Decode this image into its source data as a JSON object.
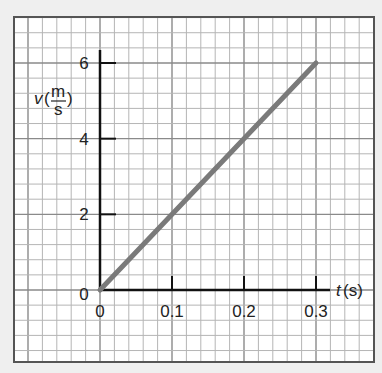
{
  "header": {
    "partial_title": "graph"
  },
  "chart_data": {
    "type": "line",
    "title": "",
    "xlabel": "t(s)",
    "ylabel": "v(m/s)",
    "ylabel_parts": {
      "var": "v",
      "num": "m",
      "den": "s"
    },
    "xlabel_parts": {
      "var": "t",
      "unit": "(s)"
    },
    "x_ticks": [
      0,
      0.1,
      0.2,
      0.3
    ],
    "x_tick_labels": [
      "0",
      "0.1",
      "0.2",
      "0.3"
    ],
    "y_ticks": [
      0,
      2,
      4,
      6
    ],
    "y_tick_labels": [
      "0",
      "2",
      "4",
      "6"
    ],
    "xlim": [
      0,
      0.3
    ],
    "ylim": [
      0,
      6
    ],
    "grid": true,
    "series": [
      {
        "name": "velocity",
        "x": [
          0,
          0.3
        ],
        "y": [
          0,
          6
        ],
        "color": "#7a7a7a"
      }
    ]
  }
}
